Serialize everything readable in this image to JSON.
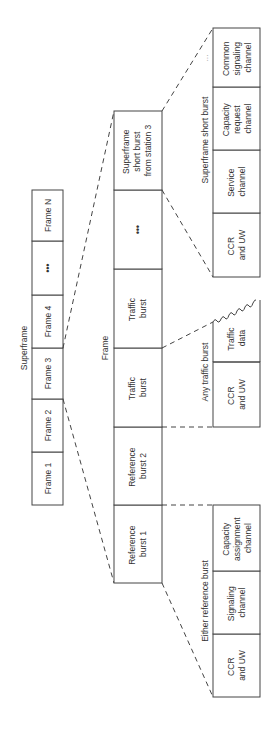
{
  "superframe": {
    "label": "Superframe",
    "frames": [
      "Frame 1",
      "Frame 2",
      "Frame 3",
      "Frame 4",
      "•••",
      "Frame N"
    ]
  },
  "frame": {
    "label": "Frame",
    "bursts": [
      [
        "Reference",
        "burst 1"
      ],
      [
        "Reference",
        "burst 2"
      ],
      [
        "Traffic",
        "burst"
      ],
      [
        "Traffic",
        "burst"
      ],
      [
        "•••"
      ],
      [
        "Superframe",
        "short burst",
        "from station 3"
      ]
    ]
  },
  "reference_burst": {
    "label": "Either reference burst",
    "fields": [
      [
        "CCR",
        "and UW"
      ],
      [
        "Signaling",
        "channel"
      ],
      [
        "Capacity",
        "assignment",
        "channel"
      ]
    ]
  },
  "traffic_burst": {
    "label": "Any traffic burst",
    "fields": [
      [
        "CCR",
        "and UW"
      ],
      [
        "Traffic",
        "data"
      ]
    ]
  },
  "short_burst": {
    "label": "Superframe short burst",
    "fields": [
      [
        "CCR",
        "and UW"
      ],
      [
        "Service",
        "channel"
      ],
      [
        "Capacity",
        "request",
        "channel"
      ],
      [
        "Common",
        "signaling",
        "channel"
      ]
    ],
    "ellipsis": "..."
  }
}
